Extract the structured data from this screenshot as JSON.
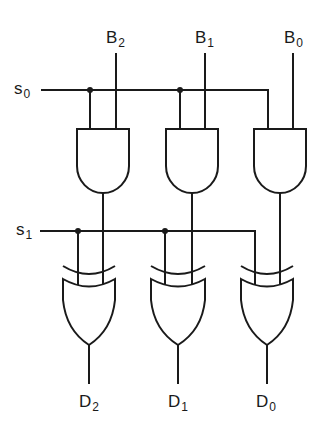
{
  "diagram": {
    "type": "logic-circuit",
    "inputs": {
      "s0": {
        "base": "s",
        "sub": "0"
      },
      "s1": {
        "base": "s",
        "sub": "1"
      },
      "b2": {
        "base": "B",
        "sub": "2"
      },
      "b1": {
        "base": "B",
        "sub": "1"
      },
      "b0": {
        "base": "B",
        "sub": "0"
      }
    },
    "outputs": {
      "d2": {
        "base": "D",
        "sub": "2"
      },
      "d1": {
        "base": "D",
        "sub": "1"
      },
      "d0": {
        "base": "D",
        "sub": "0"
      }
    },
    "gates": [
      {
        "id": "and2",
        "type": "AND",
        "inputs": [
          "s0",
          "B2"
        ]
      },
      {
        "id": "and1",
        "type": "AND",
        "inputs": [
          "s0",
          "B1"
        ]
      },
      {
        "id": "and0",
        "type": "AND",
        "inputs": [
          "s0",
          "B0"
        ]
      },
      {
        "id": "xor2",
        "type": "XOR",
        "inputs": [
          "s1",
          "and2"
        ],
        "output": "D2"
      },
      {
        "id": "xor1",
        "type": "XOR",
        "inputs": [
          "s1",
          "and1"
        ],
        "output": "D1"
      },
      {
        "id": "xor0",
        "type": "XOR",
        "inputs": [
          "s1",
          "and0"
        ],
        "output": "D0"
      }
    ]
  }
}
